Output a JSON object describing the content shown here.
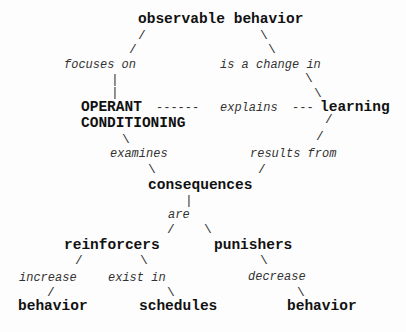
{
  "diagram": {
    "type": "concept-map",
    "nodes": {
      "observable_behavior": "observable behavior",
      "operant": "OPERANT",
      "conditioning": "CONDITIONING",
      "learning": "learning",
      "consequences": "consequences",
      "reinforcers": "reinforcers",
      "punishers": "punishers",
      "behavior_left": "behavior",
      "schedules": "schedules",
      "behavior_right": "behavior"
    },
    "links": {
      "focuses_on": "focuses on",
      "is_a_change_in": "is a change in",
      "explains": "explains",
      "examines": "examines",
      "results_from": "results from",
      "are": "are",
      "increase": "increase",
      "exist_in": "exist in",
      "decrease": "decrease"
    },
    "connectors": {
      "slash": "/",
      "backslash": "\\",
      "pipe": "|",
      "dash_long": "------",
      "dash_short": "---"
    },
    "edges": [
      {
        "from": "observable behavior",
        "label": "focuses on",
        "to": "OPERANT CONDITIONING"
      },
      {
        "from": "observable behavior",
        "label": "is a change in",
        "to": "learning"
      },
      {
        "from": "OPERANT CONDITIONING",
        "label": "explains",
        "to": "learning"
      },
      {
        "from": "OPERANT CONDITIONING",
        "label": "examines",
        "to": "consequences"
      },
      {
        "from": "learning",
        "label": "results from",
        "to": "consequences"
      },
      {
        "from": "consequences",
        "label": "are",
        "to": "reinforcers"
      },
      {
        "from": "consequences",
        "label": "are",
        "to": "punishers"
      },
      {
        "from": "reinforcers",
        "label": "increase",
        "to": "behavior"
      },
      {
        "from": "reinforcers",
        "label": "exist in",
        "to": "schedules"
      },
      {
        "from": "punishers",
        "label": "decrease",
        "to": "behavior"
      }
    ]
  }
}
